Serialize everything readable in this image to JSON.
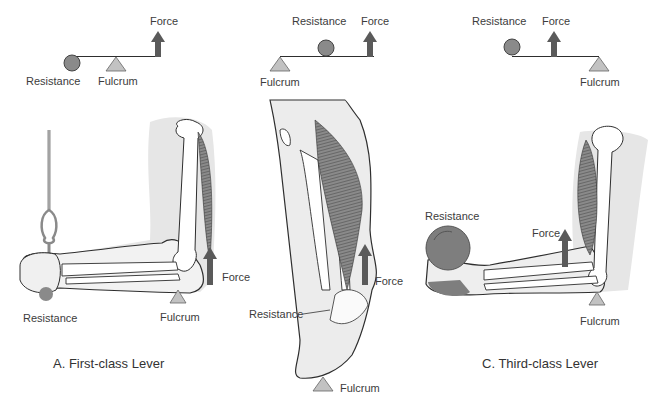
{
  "colors": {
    "arrow": "#5a5a5a",
    "fulcrum": "#c2c2c2",
    "resistance_ball": "#8a8a8a",
    "dumbbell": "#7e7e7e",
    "skin": "#ececec",
    "muscle": "#6f6f6f",
    "outline": "#2e2e2e",
    "text": "#3c3c3c"
  },
  "panels": [
    {
      "id": "A",
      "caption": "A. First-class Lever",
      "schematic": {
        "force_label": "Force",
        "resistance_label": "Resistance",
        "fulcrum_label": "Fulcrum",
        "order": [
          "resistance",
          "fulcrum",
          "force"
        ]
      },
      "illustration": {
        "subject": "arm extended with cable handle (triceps extension)",
        "force_label": "Force",
        "resistance_label": "Resistance",
        "fulcrum_label": "Fulcrum"
      }
    },
    {
      "id": "B",
      "caption": "",
      "schematic": {
        "force_label": "Force",
        "resistance_label": "Resistance",
        "fulcrum_label": "Fulcrum",
        "order": [
          "fulcrum",
          "resistance",
          "force"
        ]
      },
      "illustration": {
        "subject": "lower leg raising onto toes (calf raise)",
        "force_label": "Force",
        "resistance_label": "Resistance",
        "fulcrum_label": "Fulcrum"
      }
    },
    {
      "id": "C",
      "caption": "C. Third-class Lever",
      "schematic": {
        "force_label": "Force",
        "resistance_label": "Resistance",
        "fulcrum_label": "Fulcrum",
        "order": [
          "resistance",
          "force",
          "fulcrum"
        ]
      },
      "illustration": {
        "subject": "arm holding dumbbell (biceps curl)",
        "force_label": "Force",
        "resistance_label": "Resistance",
        "fulcrum_label": "Fulcrum"
      }
    }
  ]
}
